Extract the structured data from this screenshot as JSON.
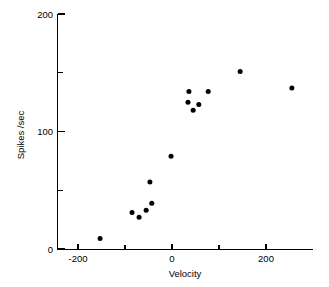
{
  "chart_data": {
    "type": "scatter",
    "title": "",
    "xlabel": "Velocity",
    "ylabel": "Spikes /sec",
    "xlim": [
      -245,
      300
    ],
    "ylim": [
      0,
      200
    ],
    "grid": false,
    "legend": null,
    "x_major_ticks": [
      -200,
      0,
      200
    ],
    "x_minor_ticks": [
      -100,
      100
    ],
    "x_tick_labels": [
      "-200",
      "0",
      "200"
    ],
    "y_major_ticks": [
      0,
      100,
      200
    ],
    "y_minor_ticks": [
      50,
      150
    ],
    "y_tick_labels": [
      "0",
      "100",
      "200"
    ],
    "marker": "filled-circle",
    "marker_color": "#000000",
    "marker_size_px": 5,
    "points": [
      {
        "x": -153,
        "y": 9
      },
      {
        "x": -85,
        "y": 31
      },
      {
        "x": -70,
        "y": 27
      },
      {
        "x": -55,
        "y": 33
      },
      {
        "x": -43,
        "y": 39
      },
      {
        "x": -47,
        "y": 57
      },
      {
        "x": -2,
        "y": 79
      },
      {
        "x": 36,
        "y": 134
      },
      {
        "x": 34,
        "y": 125
      },
      {
        "x": 45,
        "y": 118
      },
      {
        "x": 57,
        "y": 123
      },
      {
        "x": 77,
        "y": 134
      },
      {
        "x": 145,
        "y": 151
      },
      {
        "x": 255,
        "y": 137
      }
    ]
  },
  "figure": {
    "background_color": "#ffffff",
    "axis_color": "#000000"
  }
}
